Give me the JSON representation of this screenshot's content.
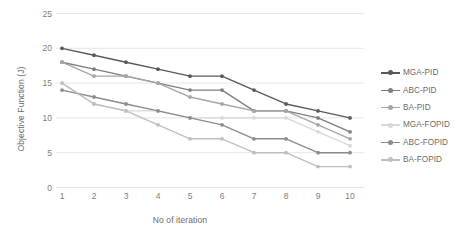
{
  "chart_data": {
    "type": "line",
    "title": "",
    "xlabel": "No of iteration",
    "ylabel": "Objective Function (J)",
    "x": [
      1,
      2,
      3,
      4,
      5,
      6,
      7,
      8,
      9,
      10
    ],
    "xticklabels": [
      "1",
      "2",
      "3",
      "4",
      "5",
      "6",
      "7",
      "8",
      "9",
      "10"
    ],
    "yticklabels": [
      "0",
      "5",
      "10",
      "15",
      "20",
      "25"
    ],
    "yticks": [
      0,
      5,
      10,
      15,
      20,
      25
    ],
    "ylim": [
      0,
      25
    ],
    "xlim": [
      1,
      10
    ],
    "grid": "horizontal",
    "legend_position": "right",
    "markers": "circle",
    "series": [
      {
        "name": "MGA-PID",
        "color": "#595959",
        "values": [
          20,
          19,
          18,
          17,
          16,
          16,
          14,
          12,
          11,
          10
        ]
      },
      {
        "name": "ABC-PID",
        "color": "#7f7f7f",
        "values": [
          18,
          17,
          16,
          15,
          14,
          14,
          11,
          11,
          10,
          8
        ]
      },
      {
        "name": "BA-PID",
        "color": "#a6a6a6",
        "values": [
          18,
          16,
          16,
          15,
          13,
          12,
          11,
          11,
          9,
          7
        ]
      },
      {
        "name": "MGA-FOPID",
        "color": "#d9d9d9",
        "values": [
          15,
          12,
          11,
          11,
          10,
          10,
          10,
          10,
          8,
          6
        ]
      },
      {
        "name": "ABC-FOPID",
        "color": "#8c8c8c",
        "values": [
          14,
          13,
          12,
          11,
          10,
          9,
          7,
          7,
          5,
          5
        ]
      },
      {
        "name": "BA-FOPID",
        "color": "#bfbfbf",
        "values": [
          15,
          12,
          11,
          9,
          7,
          7,
          5,
          5,
          3,
          3
        ]
      }
    ]
  },
  "colors": {
    "gridline": "#e4e4e4",
    "axis_text": "#7d7d7d",
    "title_text": "#6b6b6b",
    "background": "#ffffff"
  }
}
